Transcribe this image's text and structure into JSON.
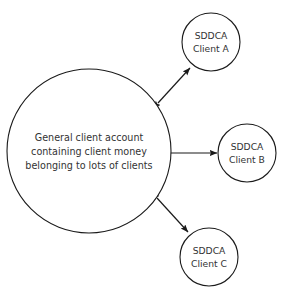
{
  "diagram": {
    "background_color": "#ffffff",
    "stroke_color": "#1a1a1a",
    "text_color": "#333333",
    "main_node": {
      "id": "general-client-account",
      "center_x": 89,
      "center_y": 151,
      "radius": 82,
      "lines": [
        "General client account",
        "containing client money",
        "belonging to lots of clients"
      ],
      "line1": "General client account",
      "line2": "containing client money",
      "line3": "belonging to lots of clients"
    },
    "client_nodes": [
      {
        "id": "sddca-client-a",
        "center_x": 211,
        "center_y": 42,
        "radius": 29,
        "line1": "SDDCA",
        "line2": "Client A"
      },
      {
        "id": "sddca-client-b",
        "center_x": 247,
        "center_y": 153,
        "radius": 29,
        "line1": "SDDCA",
        "line2": "Client B"
      },
      {
        "id": "sddca-client-c",
        "center_x": 209,
        "center_y": 257,
        "radius": 29,
        "line1": "SDDCA",
        "line2": "Client C"
      }
    ],
    "connectors": [
      {
        "id": "connector-to-client-a",
        "from": "general-client-account",
        "to": "sddca-client-a",
        "arrow_style": "double-headed",
        "x1": 158,
        "y1": 103,
        "x2": 190,
        "y2": 68
      },
      {
        "id": "connector-to-client-b",
        "from": "general-client-account",
        "to": "sddca-client-b",
        "arrow_style": "double-headed",
        "x1": 170,
        "y1": 153,
        "x2": 217,
        "y2": 153
      },
      {
        "id": "connector-to-client-c",
        "from": "general-client-account",
        "to": "sddca-client-c",
        "arrow_style": "double-headed",
        "x1": 157,
        "y1": 198,
        "x2": 188,
        "y2": 232
      }
    ]
  }
}
